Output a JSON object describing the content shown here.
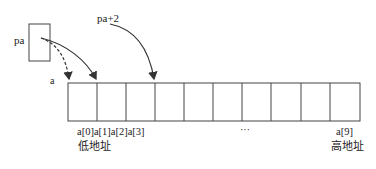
{
  "pointer": {
    "name": "pa",
    "offset_label": "pa+2"
  },
  "array": {
    "name": "a",
    "length": 10,
    "index_labels_left": "a[0]a[1]a[2]a[3]",
    "ellipsis": "···",
    "index_label_last": "a[9]",
    "low_address": "低地址",
    "high_address": "高地址"
  },
  "colors": {
    "stroke": "#333333",
    "background": "#ffffff"
  }
}
